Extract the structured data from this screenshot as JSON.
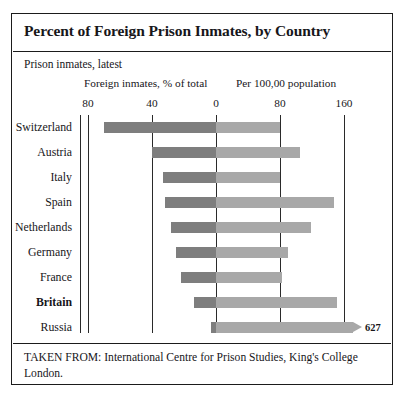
{
  "figure": {
    "title": "Percent of Foreign Prison Inmates, by Country",
    "subtitle": "Prison inmates, latest",
    "column_headers": {
      "left": "Foreign inmates, % of total",
      "right": "Per 100,00 population"
    },
    "footer": "TAKEN FROM: International Centre for Prison Studies, King's College London."
  },
  "colors": {
    "bar_left": "#7e7e7e",
    "bar_right": "#a8a8a8",
    "frame": "#1b1b1b",
    "gridline": "#2a2a2a",
    "background": "#ffffff"
  },
  "chart_data": {
    "type": "bar",
    "title": "Percent of Foreign Prison Inmates, by Country",
    "subtitle": "Prison inmates, latest",
    "orientation": "horizontal",
    "layout": "back-to-back bidirectional bars sharing a central zero axis",
    "grid": true,
    "legend_position": "column headers above each half",
    "categories": [
      "Switzerland",
      "Austria",
      "Italy",
      "Spain",
      "Netherlands",
      "Germany",
      "France",
      "Britain",
      "Russia"
    ],
    "highlighted_category": "Britain",
    "series": [
      {
        "name": "Foreign inmates, % of total",
        "side": "left",
        "xlabel": "Foreign inmates, % of total",
        "axis_direction": "right-to-left",
        "ticks": [
          80,
          40,
          0
        ],
        "xlim": [
          80,
          0
        ],
        "color": "#7e7e7e",
        "values": [
          70,
          40,
          33,
          32,
          28,
          25,
          22,
          14,
          3
        ]
      },
      {
        "name": "Per 100,00 population",
        "side": "right",
        "xlabel": "Per 100,00 population",
        "axis_direction": "left-to-right",
        "ticks": [
          0,
          80,
          160
        ],
        "xlim": [
          0,
          160
        ],
        "color": "#a8a8a8",
        "values": [
          80,
          105,
          80,
          148,
          119,
          90,
          83,
          151,
          627
        ],
        "annotations": [
          {
            "category": "Russia",
            "label": "627",
            "note": "bar truncated with arrow break at axis edge"
          }
        ]
      }
    ],
    "axis_ticks_left": [
      "80",
      "40",
      "0"
    ],
    "axis_ticks_right": [
      "80",
      "160"
    ]
  }
}
